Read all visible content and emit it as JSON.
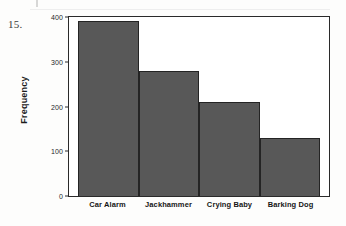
{
  "item_number": "15.",
  "chart_data": {
    "type": "bar",
    "title": "",
    "xlabel": "",
    "ylabel": "Frequency",
    "categories": [
      "Car Alarm",
      "Jackhammer",
      "Crying Baby",
      "Barking Dog"
    ],
    "values": [
      390,
      280,
      210,
      130
    ],
    "ylim": [
      0,
      400
    ],
    "yticks": [
      0,
      100,
      200,
      300,
      400
    ],
    "ytick_labels": [
      "0",
      "100",
      "200",
      "300",
      "400"
    ],
    "grid": false,
    "legend": null,
    "bar_color": "#585858",
    "bar_border_color": "#242424",
    "frame_color": "#2a2a2a",
    "plot_background": "#ffffff"
  }
}
